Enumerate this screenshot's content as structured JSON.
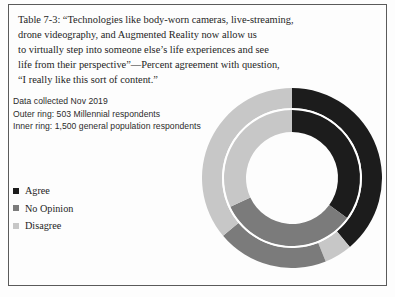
{
  "figure": {
    "caption_lines": [
      "Table 7-3: “Technologies like body-worn cameras, live-streaming,",
      "drone videography, and Augmented Reality now allow us",
      "to virtually step into someone else’s life experiences and see",
      "life from their perspective”—Percent agreement with question,",
      "“I really like this sort of content.”"
    ],
    "note_lines": [
      "Data collected Nov 2019",
      "Outer ring: 503 Millennial respondents",
      "Inner ring: 1,500 general population respondents"
    ]
  },
  "legend": {
    "items": [
      {
        "label": "Agree",
        "color": "#1c1c1c"
      },
      {
        "label": "No Opinion",
        "color": "#7b7b7b"
      },
      {
        "label": "Disagree",
        "color": "#c7c7c7"
      }
    ]
  },
  "colors": {
    "agree": "#1c1c1c",
    "no_opinion": "#7b7b7b",
    "disagree": "#c7c7c7",
    "separator": "#ffffff",
    "background": "#fdfdfd",
    "frame": "#5a5a5a",
    "text": "#1d1d1d"
  },
  "chart_data": {
    "type": "pie",
    "variant": "nested-donut",
    "subtitle": "Data collected Nov 2019",
    "xlabel": "",
    "ylabel": "",
    "grid": false,
    "legend_position": "left",
    "categories": [
      "Agree",
      "No Opinion",
      "Disagree"
    ],
    "units": "percent",
    "start_angle_deg": 0,
    "direction": "clockwise",
    "rings": [
      {
        "name": "Outer ring",
        "ring": "outer",
        "audience": "503 Millennial respondents",
        "sample_size": 503,
        "radius_outer_px": 90,
        "radius_inner_px": 70,
        "segments": [
          {
            "label": "Agree",
            "value": 39,
            "color": "#1c1c1c",
            "start_deg": 0,
            "end_deg": 140
          },
          {
            "label": "Disagree",
            "value": 5,
            "color": "#c7c7c7",
            "start_deg": 140,
            "end_deg": 158
          },
          {
            "label": "No Opinion",
            "value": 20,
            "color": "#7b7b7b",
            "start_deg": 158,
            "end_deg": 230
          },
          {
            "label": "Disagree",
            "value": 36,
            "color": "#c7c7c7",
            "start_deg": 230,
            "end_deg": 360
          }
        ]
      },
      {
        "name": "Inner ring",
        "ring": "inner",
        "audience": "1,500 general population respondents",
        "sample_size": 1500,
        "radius_outer_px": 68,
        "radius_inner_px": 46,
        "segments": [
          {
            "label": "Agree",
            "value": 35,
            "color": "#1c1c1c",
            "start_deg": 0,
            "end_deg": 126
          },
          {
            "label": "No Opinion",
            "value": 33,
            "color": "#7b7b7b",
            "start_deg": 126,
            "end_deg": 245
          },
          {
            "label": "Disagree",
            "value": 32,
            "color": "#c7c7c7",
            "start_deg": 245,
            "end_deg": 360
          }
        ]
      }
    ]
  }
}
